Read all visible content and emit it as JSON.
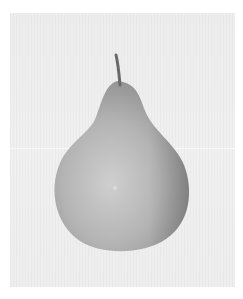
{
  "image": {
    "subject": "pear",
    "style": "grayscale photograph",
    "colors": {
      "border": "#ffffff",
      "background": "#eeeeee",
      "pear_light": "#c8c8c8",
      "pear_mid": "#a8a8a8",
      "pear_dark": "#8a8a8a",
      "stem": "#6a6a6a"
    }
  }
}
